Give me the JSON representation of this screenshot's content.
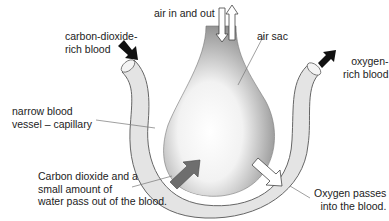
{
  "diagram": {
    "labels": {
      "air_in_out": "air in and out",
      "air_sac": "air sac",
      "co2_blood": [
        "carbon-dioxide-",
        "rich blood"
      ],
      "o2_blood": [
        "oxygen-",
        "rich blood"
      ],
      "capillary": [
        "narrow blood",
        "vessel – capillary"
      ],
      "co2_out": [
        "Carbon dioxide and a",
        "small amount of",
        "water pass out of the blood."
      ],
      "o2_in": [
        "Oxygen passes",
        "into the blood."
      ]
    },
    "colors": {
      "vessel_fill": "#e4e4e4",
      "vessel_stroke": "#666666",
      "sac_dark": "#8a8a8a",
      "sac_light": "#ffffff",
      "co2_arrow": "#6e6e6e",
      "o2_arrow": "#ffffff",
      "blood_arrow": "#111111",
      "leader_line": "#777777"
    }
  }
}
